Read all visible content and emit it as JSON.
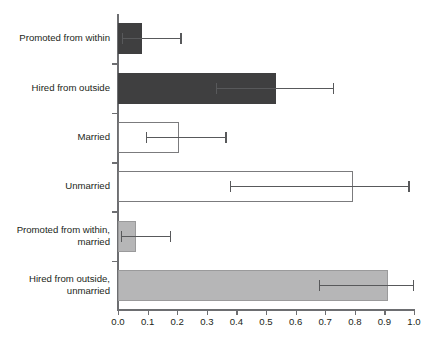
{
  "chart_data": {
    "type": "bar",
    "orientation": "horizontal",
    "title": "",
    "subtitle": "",
    "xlabel": "",
    "ylabel": "",
    "xlim": [
      0.0,
      1.0
    ],
    "xticks": [
      "0.0",
      "0.1",
      "0.2",
      "0.3",
      "0.4",
      "0.5",
      "0.6",
      "0.7",
      "0.8",
      "0.9",
      "1.0"
    ],
    "xtick_values": [
      0.0,
      0.1,
      0.2,
      0.3,
      0.4,
      0.5,
      0.6,
      0.7,
      0.8,
      0.9,
      1.0
    ],
    "grid": false,
    "legend": "none",
    "categories": [
      "Promoted from within",
      "Hired from outside",
      "Married",
      "Unmarried",
      "Promoted from within,\nmarried",
      "Hired from outside,\nunmarried"
    ],
    "values": [
      0.08,
      0.535,
      0.207,
      0.795,
      0.06,
      0.913
    ],
    "error_low": [
      0.012,
      0.33,
      0.095,
      0.378,
      0.01,
      0.68
    ],
    "error_high": [
      0.215,
      0.73,
      0.367,
      0.985,
      0.18,
      1.0
    ],
    "bar_styles": [
      "dark",
      "dark",
      "white",
      "white",
      "gray",
      "gray"
    ],
    "colors": {
      "dark": "#3f3f40",
      "white": "#ffffff",
      "gray": "#b6b6b7",
      "outline": "#7b7b7d",
      "axis": "#6d6e71",
      "error": "#58595b",
      "text": "#231f20"
    },
    "bars": [
      {
        "label": "Promoted from within",
        "value": 0.08,
        "error_low": 0.012,
        "error_high": 0.215,
        "style": "dark"
      },
      {
        "label": "Hired from outside",
        "value": 0.535,
        "error_low": 0.33,
        "error_high": 0.73,
        "style": "dark"
      },
      {
        "label": "Married",
        "value": 0.207,
        "error_low": 0.095,
        "error_high": 0.367,
        "style": "white"
      },
      {
        "label": "Unmarried",
        "value": 0.795,
        "error_low": 0.378,
        "error_high": 0.985,
        "style": "white"
      },
      {
        "label": "Promoted from within,\nmarried",
        "value": 0.06,
        "error_low": 0.01,
        "error_high": 0.18,
        "style": "gray"
      },
      {
        "label": "Hired from outside,\nunmarried",
        "value": 0.913,
        "error_low": 0.68,
        "error_high": 1.0,
        "style": "gray"
      }
    ]
  }
}
